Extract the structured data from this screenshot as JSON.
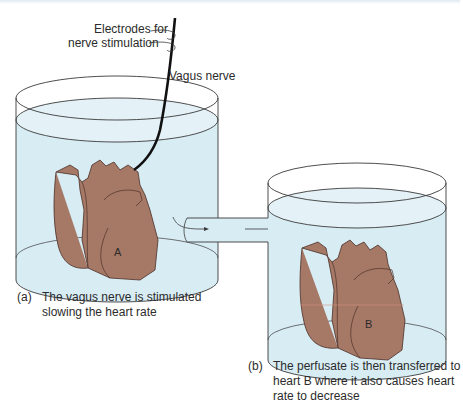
{
  "diagram": {
    "labels": {
      "electrodes_line1": "Electrodes for",
      "electrodes_line2": "nerve stimulation",
      "vagus_nerve": "Vagus nerve"
    },
    "hearts": {
      "a": "A",
      "b": "B"
    },
    "captions": {
      "a_tag": "(a)",
      "a_line1": "The vagus nerve is stimulated",
      "a_line2": "slowing the heart rate",
      "b_tag": "(b)",
      "b_line1": "The perfusate is then transferred to",
      "b_line2": "heart B where it also causes heart",
      "b_line3": "rate to decrease"
    },
    "colors": {
      "fluid": "#d8ecf4",
      "heart": "#a67866",
      "outline": "#3a3a3a",
      "nerve": "#111111"
    }
  }
}
